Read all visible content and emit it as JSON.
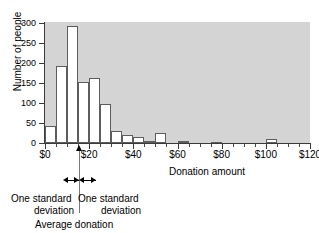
{
  "chart_data": {
    "type": "bar",
    "title": "",
    "subtitle": "",
    "xlabel": "Donation amount",
    "ylabel": "Number of people",
    "xlim": [
      0,
      120
    ],
    "ylim": [
      0,
      320
    ],
    "bin_width": 5,
    "grid": false,
    "legend": "none",
    "x_tick_labels": [
      "$0",
      "$20",
      "$40",
      "$60",
      "$80",
      "$100",
      "$120"
    ],
    "x_tick_values": [
      0,
      20,
      40,
      60,
      80,
      100,
      120
    ],
    "x_minor_tick_step": 5,
    "y_tick_labels": [
      "0",
      "50",
      "100",
      "150",
      "200",
      "250",
      "300"
    ],
    "y_tick_values": [
      0,
      50,
      100,
      150,
      200,
      250,
      300
    ],
    "categories": [
      "0-5",
      "5-10",
      "10-15",
      "15-20",
      "20-25",
      "25-30",
      "30-35",
      "35-40",
      "40-45",
      "45-50",
      "50-55",
      "55-60",
      "60-65",
      "65-70",
      "70-75",
      "75-80",
      "80-85",
      "85-90",
      "90-95",
      "95-100",
      "100-105",
      "105-110",
      "110-115",
      "115-120"
    ],
    "bins": [
      {
        "start": 0,
        "end": 5,
        "value": 43
      },
      {
        "start": 5,
        "end": 10,
        "value": 192
      },
      {
        "start": 10,
        "end": 15,
        "value": 293
      },
      {
        "start": 15,
        "end": 20,
        "value": 152
      },
      {
        "start": 20,
        "end": 25,
        "value": 163
      },
      {
        "start": 25,
        "end": 30,
        "value": 97
      },
      {
        "start": 30,
        "end": 35,
        "value": 30
      },
      {
        "start": 35,
        "end": 40,
        "value": 20
      },
      {
        "start": 40,
        "end": 45,
        "value": 14
      },
      {
        "start": 45,
        "end": 50,
        "value": 6
      },
      {
        "start": 50,
        "end": 55,
        "value": 25
      },
      {
        "start": 55,
        "end": 60,
        "value": 0
      },
      {
        "start": 60,
        "end": 65,
        "value": 4
      },
      {
        "start": 65,
        "end": 70,
        "value": 0
      },
      {
        "start": 70,
        "end": 75,
        "value": 0
      },
      {
        "start": 75,
        "end": 80,
        "value": 3
      },
      {
        "start": 80,
        "end": 85,
        "value": 0
      },
      {
        "start": 85,
        "end": 90,
        "value": 0
      },
      {
        "start": 90,
        "end": 95,
        "value": 0
      },
      {
        "start": 95,
        "end": 100,
        "value": 0
      },
      {
        "start": 100,
        "end": 105,
        "value": 9
      },
      {
        "start": 105,
        "end": 110,
        "value": 0
      },
      {
        "start": 110,
        "end": 115,
        "value": 0
      },
      {
        "start": 115,
        "end": 120,
        "value": 0
      }
    ],
    "values": [
      43,
      192,
      293,
      152,
      163,
      97,
      30,
      20,
      14,
      6,
      25,
      0,
      4,
      0,
      0,
      3,
      0,
      0,
      0,
      0,
      9,
      0,
      0,
      0
    ],
    "annotations": {
      "mean_value": 15.5,
      "mean_label": "Average donation",
      "sd_left_line1": "One standard",
      "sd_left_line2": "deviation",
      "sd_right_line1": "One standard",
      "sd_right_line2": "deviation",
      "sd_left_span": [
        8.0,
        15.5
      ],
      "sd_right_span": [
        15.5,
        23.0
      ]
    }
  },
  "colors": {
    "plot_background": "#d4d4d4",
    "page_background": "#ffffff",
    "bar_fill": "#ffffff",
    "bar_stroke": "#5d5d5d",
    "axis": "#3a3a3a",
    "text": "#000000",
    "mean_line": "#7a7a7a"
  }
}
